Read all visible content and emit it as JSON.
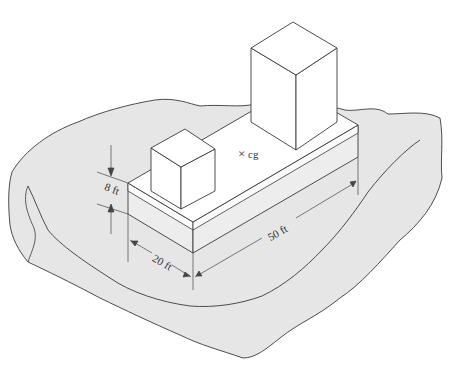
{
  "figure": {
    "labels": {
      "height": "8 ft",
      "width": "20 ft",
      "length": "50 ft",
      "cg": "cg",
      "cg_marker": "×"
    },
    "colors": {
      "ground": "#e6e6e6",
      "slab_side": "#ededed",
      "slab_top": "#ffffff",
      "block": "#ffffff",
      "line": "#3a3a3a",
      "dimension": "#444444"
    }
  }
}
